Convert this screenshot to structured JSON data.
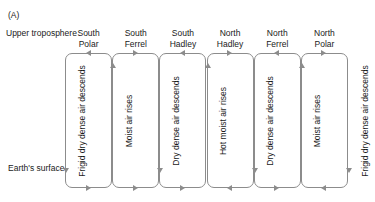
{
  "figure": {
    "panel_label": "(A)",
    "top_axis_label": "Upper troposphere",
    "bottom_axis_label": "Earth's surface",
    "line_color": "#8c8c8c",
    "text_color": "#1a1a1a",
    "background": "#ffffff"
  },
  "columns": [
    {
      "line1": "South",
      "line2": "Polar"
    },
    {
      "line1": "South",
      "line2": "Ferrel"
    },
    {
      "line1": "South",
      "line2": "Hadley"
    },
    {
      "line1": "North",
      "line2": "Hadley"
    },
    {
      "line1": "North",
      "line2": "Ferrel"
    },
    {
      "line1": "North",
      "line2": "Polar"
    }
  ],
  "cells": [
    {
      "name": "south-polar",
      "label": "Frigid dry dense air descends",
      "top_arrow": "left",
      "bottom_arrow": "right"
    },
    {
      "name": "south-ferrel",
      "label": "Moist air rises",
      "top_arrow": "right",
      "bottom_arrow": "right"
    },
    {
      "name": "south-hadley",
      "label": "Dry dense air descends",
      "top_arrow": "left",
      "bottom_arrow": "right"
    },
    {
      "name": "north-hadley",
      "label": "Hot moist air rises",
      "top_arrow": "right",
      "bottom_arrow": "left"
    },
    {
      "name": "north-ferrel",
      "label": "Dry dense air descends",
      "top_arrow": "left",
      "bottom_arrow": "right"
    },
    {
      "name": "north-polar",
      "label": "Moist air rises",
      "top_arrow": "right",
      "bottom_arrow": "left"
    }
  ],
  "boundary_labels": [
    "Frigid dry dense air descends",
    "Moist air rises",
    "Dry dense air descends",
    "Hot moist air rises",
    "Dry dense air descends",
    "Moist air rises",
    "Frigid dry dense air descends"
  ],
  "boundary_flow": [
    "down",
    "up",
    "down",
    "up",
    "down",
    "up",
    "down"
  ],
  "chart_data": {
    "type": "diagram",
    "cell_names": [
      "South Polar",
      "South Ferrel",
      "South Hadley",
      "North Hadley",
      "North Ferrel",
      "North Polar"
    ],
    "vertical_branches": [
      "Frigid dry dense air descends",
      "Moist air rises",
      "Dry dense air descends",
      "Hot moist air rises",
      "Dry dense air descends",
      "Moist air rises",
      "Frigid dry dense air descends"
    ],
    "vertical_directions": [
      "down",
      "up",
      "down",
      "up",
      "down",
      "up",
      "down"
    ],
    "top_flow_directions": [
      "left",
      "right",
      "left",
      "right",
      "left",
      "right"
    ],
    "bottom_flow_directions": [
      "right",
      "right",
      "right",
      "left",
      "right",
      "left"
    ]
  }
}
